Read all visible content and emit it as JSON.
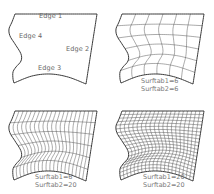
{
  "figure": {
    "stroke_color": "#3a3a3a",
    "mesh_color": "#555555",
    "text_color": "#666666"
  },
  "panels": [
    {
      "id": "edges",
      "offset": [
        0,
        0
      ],
      "mesh": null,
      "edge_labels": [
        {
          "text": "Edge 1",
          "x": 39,
          "y": 16
        },
        {
          "text": "Edge 4",
          "x": 19,
          "y": 35
        },
        {
          "text": "Edge 2",
          "x": 66,
          "y": 46
        },
        {
          "text": "Edge 3",
          "x": 39,
          "y": 66
        }
      ],
      "caption": []
    },
    {
      "id": "surftab-6x6",
      "offset": [
        107,
        0
      ],
      "mesh": {
        "surftab1": 6,
        "surftab2": 6
      },
      "edge_labels": [],
      "caption": [
        "Surftab1=6",
        "Surftab2=6"
      ],
      "caption_pos": [
        35,
        79
      ]
    },
    {
      "id": "surftab-6x20",
      "offset": [
        0,
        97
      ],
      "mesh": {
        "surftab1": 6,
        "surftab2": 20
      },
      "edge_labels": [],
      "caption": [
        "Surftab1=6",
        "Surftab2=20"
      ],
      "caption_pos": [
        35,
        76
      ]
    },
    {
      "id": "surftab-20x20",
      "offset": [
        107,
        97
      ],
      "mesh": {
        "surftab1": 20,
        "surftab2": 20
      },
      "edge_labels": [],
      "caption": [
        "Surftab1=20",
        "Surftab2=20"
      ],
      "caption_pos": [
        38,
        76
      ]
    }
  ],
  "shape": {
    "top": [
      [
        15,
        14
      ],
      [
        97,
        14
      ]
    ],
    "right": [
      [
        97,
        14
      ],
      [
        86,
        84
      ]
    ],
    "bottom": [
      [
        14,
        83
      ],
      [
        32,
        76
      ],
      [
        50,
        74
      ],
      [
        68,
        77
      ],
      [
        86,
        84
      ]
    ],
    "left": [
      [
        15,
        14
      ],
      [
        12,
        22
      ],
      [
        9,
        29
      ],
      [
        10,
        36
      ],
      [
        15,
        44
      ],
      [
        21,
        54
      ],
      [
        21,
        61
      ],
      [
        16,
        67
      ],
      [
        13,
        72
      ],
      [
        13,
        79
      ],
      [
        14,
        83
      ]
    ]
  },
  "labels": {
    "p0_e1": "Edge 1",
    "p0_e4": "Edge 4",
    "p0_e2": "Edge 2",
    "p0_e3": "Edge 3",
    "p1_c1": "Surftab1=6",
    "p1_c2": "Surftab2=6",
    "p2_c1": "Surftab1=6",
    "p2_c2": "Surftab2=20",
    "p3_c1": "Surftab1=20",
    "p3_c2": "Surftab2=20"
  }
}
